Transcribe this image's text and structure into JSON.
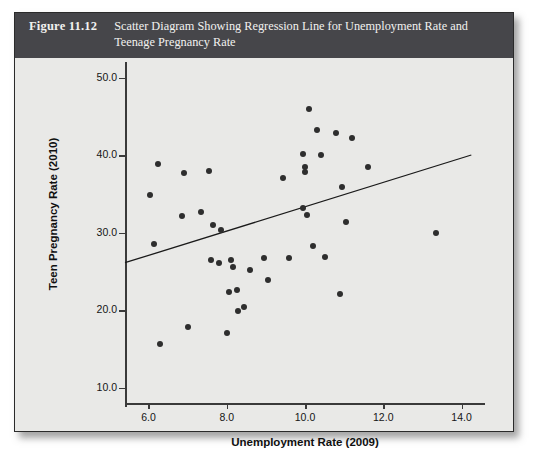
{
  "figure": {
    "number": "Figure 11.12",
    "title": "Scatter Diagram Showing Regression Line for Unemployment Rate and Teenage Pregnancy Rate",
    "caption_bg": "#46464a",
    "panel_bg": "#e9e9e7",
    "point_color": "#2e2e2e",
    "line_color": "#1a1a1a"
  },
  "chart_data": {
    "type": "scatter",
    "title": "Scatter Diagram Showing Regression Line for Unemployment Rate and Teenage Pregnancy Rate",
    "xlabel": "Unemployment Rate (2009)",
    "ylabel": "Teen Pregnancy Rate (2010)",
    "xlim": [
      5.4,
      14.6
    ],
    "ylim": [
      8.0,
      52.0
    ],
    "xticks": [
      "6.0",
      "8.0",
      "10.0",
      "12.0",
      "14.0"
    ],
    "xtick_values": [
      6.0,
      8.0,
      10.0,
      12.0,
      14.0
    ],
    "yticks": [
      "10.0",
      "20.0",
      "30.0",
      "40.0",
      "50.0"
    ],
    "ytick_values": [
      10.0,
      20.0,
      30.0,
      40.0,
      50.0
    ],
    "grid": false,
    "legend": "none",
    "points": [
      [
        6.05,
        34.9
      ],
      [
        6.15,
        28.5
      ],
      [
        6.25,
        38.9
      ],
      [
        6.3,
        15.6
      ],
      [
        6.85,
        32.1
      ],
      [
        6.9,
        37.7
      ],
      [
        7.0,
        17.8
      ],
      [
        7.35,
        32.7
      ],
      [
        7.55,
        38.0
      ],
      [
        7.6,
        26.4
      ],
      [
        7.65,
        31.0
      ],
      [
        7.8,
        26.1
      ],
      [
        7.85,
        30.3
      ],
      [
        8.0,
        17.0
      ],
      [
        8.05,
        22.3
      ],
      [
        8.1,
        26.4
      ],
      [
        8.15,
        25.6
      ],
      [
        8.25,
        22.6
      ],
      [
        8.3,
        19.9
      ],
      [
        8.45,
        20.4
      ],
      [
        8.6,
        25.1
      ],
      [
        8.95,
        26.7
      ],
      [
        9.05,
        23.9
      ],
      [
        9.45,
        37.0
      ],
      [
        9.6,
        26.7
      ],
      [
        9.95,
        40.1
      ],
      [
        9.95,
        33.2
      ],
      [
        10.0,
        38.4
      ],
      [
        10.0,
        37.8
      ],
      [
        10.05,
        32.3
      ],
      [
        10.1,
        46.0
      ],
      [
        10.2,
        28.3
      ],
      [
        10.3,
        43.2
      ],
      [
        10.4,
        40.0
      ],
      [
        10.5,
        26.8
      ],
      [
        10.8,
        42.9
      ],
      [
        10.9,
        22.1
      ],
      [
        10.95,
        35.9
      ],
      [
        11.05,
        31.3
      ],
      [
        11.2,
        42.2
      ],
      [
        11.6,
        38.4
      ],
      [
        13.35,
        29.9
      ]
    ],
    "regression_line": {
      "x_start": 5.4,
      "y_start": 26.1,
      "x_end": 14.25,
      "y_end": 40.0
    }
  }
}
